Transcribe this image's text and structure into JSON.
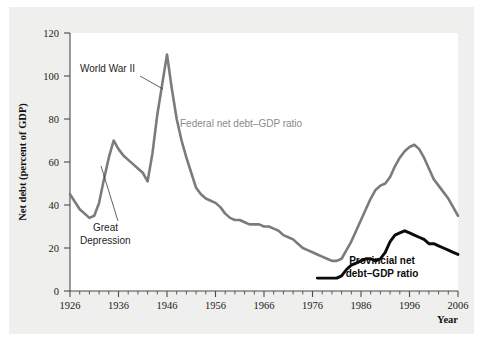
{
  "chart_data": {
    "type": "line",
    "title": "",
    "xlabel": "Year",
    "ylabel": "Net debt (percent of GDP)",
    "xlim": [
      1926,
      2006
    ],
    "ylim": [
      0,
      120
    ],
    "grid": false,
    "legend_position": "inline-annotations",
    "x_ticks": [
      1926,
      1936,
      1946,
      1956,
      1966,
      1976,
      1986,
      1996,
      2006
    ],
    "x_tick_labels": [
      "1926",
      "1936",
      "1946",
      "1956",
      "1966",
      "1976",
      "1986",
      "1996",
      "2006"
    ],
    "x_minor_tick_interval": 2,
    "y_ticks": [
      0,
      20,
      40,
      60,
      80,
      100,
      120
    ],
    "y_tick_labels": [
      "0",
      "20",
      "40",
      "60",
      "80",
      "100",
      "120"
    ],
    "series": [
      {
        "name": "Federal net debt–GDP ratio",
        "color": "#7b7b7b",
        "x": [
          1926,
          1928,
          1930,
          1931,
          1932,
          1933,
          1934,
          1935,
          1936,
          1937,
          1938,
          1939,
          1940,
          1941,
          1942,
          1943,
          1944,
          1945,
          1946,
          1947,
          1948,
          1949,
          1950,
          1951,
          1952,
          1953,
          1954,
          1955,
          1956,
          1957,
          1958,
          1959,
          1960,
          1961,
          1962,
          1963,
          1964,
          1965,
          1966,
          1967,
          1968,
          1969,
          1970,
          1971,
          1972,
          1973,
          1974,
          1975,
          1976,
          1977,
          1978,
          1979,
          1980,
          1981,
          1982,
          1983,
          1984,
          1985,
          1986,
          1987,
          1988,
          1989,
          1990,
          1991,
          1992,
          1993,
          1994,
          1995,
          1996,
          1997,
          1998,
          1999,
          2000,
          2001,
          2002,
          2003,
          2004,
          2005,
          2006
        ],
        "values": [
          45,
          38,
          34,
          35,
          41,
          52,
          62,
          70,
          66,
          63,
          61,
          59,
          57,
          55,
          51,
          64,
          82,
          96,
          110,
          94,
          80,
          70,
          62,
          55,
          48,
          45,
          43,
          42,
          41,
          39,
          36,
          34,
          33,
          33,
          32,
          31,
          31,
          31,
          30,
          30,
          29,
          28,
          26,
          25,
          24,
          22,
          20,
          19,
          18,
          17,
          16,
          15,
          14,
          14,
          15,
          19,
          23,
          28,
          33,
          38,
          43,
          47,
          49,
          50,
          53,
          58,
          62,
          65,
          67,
          68,
          66,
          62,
          57,
          52,
          49,
          46,
          43,
          39,
          35
        ]
      },
      {
        "name": "Provincial net debt–GDP ratio",
        "color": "#0b0b0b",
        "x": [
          1977,
          1978,
          1979,
          1980,
          1981,
          1982,
          1983,
          1984,
          1985,
          1986,
          1987,
          1988,
          1989,
          1990,
          1991,
          1992,
          1993,
          1994,
          1995,
          1996,
          1997,
          1998,
          1999,
          2000,
          2001,
          2002,
          2003,
          2004,
          2005,
          2006
        ],
        "values": [
          6,
          6,
          6,
          6,
          6,
          7,
          10,
          12,
          13,
          14,
          15,
          15,
          14,
          15,
          18,
          23,
          26,
          27,
          28,
          27,
          26,
          25,
          24,
          22,
          22,
          21,
          20,
          19,
          18,
          17
        ]
      }
    ],
    "annotations": [
      {
        "text": "World War II",
        "style": "plain",
        "points_to_year": 1945,
        "points_to_value": 96
      },
      {
        "text": "Great Depression",
        "lines": [
          "Great",
          "Depression"
        ],
        "style": "plain",
        "points_to_year": 1933,
        "points_to_value": 58
      },
      {
        "text": "Federal net debt–GDP ratio",
        "style": "series-gray"
      },
      {
        "text": "Provincial net debt–GDP ratio",
        "lines": [
          "Provincial net",
          "debt–GDP ratio"
        ],
        "style": "series-black-bold"
      }
    ]
  },
  "colors": {
    "federal": "#7b7b7b",
    "provincial": "#0b0b0b",
    "axis": "#4a4a4a",
    "plot_background": "#ffffff",
    "card_background": "#efefed"
  }
}
